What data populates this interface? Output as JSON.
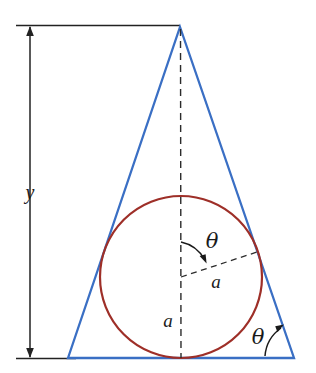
{
  "figure": {
    "name": "inscribed-circle-in-isosceles-triangle",
    "colors": {
      "triangle": "#3a6fc4",
      "circle": "#9e2f28",
      "annotation": "#1a1a1a",
      "background": "#ffffff"
    },
    "labels": {
      "height_y": "y",
      "radius_a": "a",
      "inradius_a": "a",
      "apex_half_angle_theta": "θ",
      "base_angle_theta": "θ"
    },
    "geometry": {
      "apex": [
        180,
        27
      ],
      "base_left": [
        68,
        358
      ],
      "base_right": [
        294,
        358
      ],
      "circle_center": [
        181,
        277
      ],
      "circle_radius": 81,
      "dimension_top_y": 26,
      "dimension_bottom_y": 358,
      "dimension_x": 30,
      "radius_line_end": [
        257,
        252
      ]
    }
  }
}
